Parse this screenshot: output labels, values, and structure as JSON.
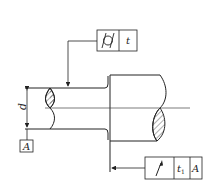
{
  "drawing": {
    "title": "Stepped shaft with geometric tolerances",
    "frame_cylindricity": {
      "symbol": "cylindricity",
      "value": "t"
    },
    "frame_runout": {
      "symbol": "circular-runout",
      "value": "t1",
      "value_main": "t",
      "value_sub": "1",
      "datum": "A"
    },
    "dimension_label": "d",
    "datum_label": "A",
    "line_color": "#222222",
    "hatch_color": "#333333"
  }
}
